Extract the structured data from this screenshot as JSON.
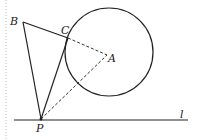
{
  "diagram": {
    "type": "geometry",
    "points": {
      "A": {
        "label": "A",
        "x": 107,
        "y": 55
      },
      "B": {
        "label": "B",
        "x": 23,
        "y": 22
      },
      "C": {
        "label": "C",
        "x": 68,
        "y": 38
      },
      "P": {
        "label": "P",
        "x": 41,
        "y": 119
      }
    },
    "circle": {
      "center": "A",
      "cx": 109,
      "cy": 52,
      "r": 44
    },
    "line": {
      "label": "l",
      "x1": 14,
      "y1": 120,
      "x2": 188,
      "y2": 120
    },
    "segments_solid": [
      "BC",
      "BP",
      "CP"
    ],
    "segments_dashed": [
      "CA",
      "PA"
    ],
    "colors": {
      "stroke": "#222222",
      "background": "#ffffff"
    }
  }
}
